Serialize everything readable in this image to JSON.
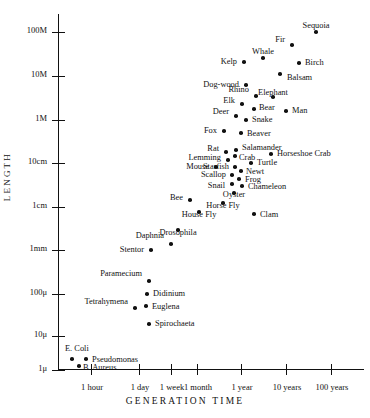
{
  "chart_data": {
    "type": "scatter",
    "title": "",
    "xlabel": "GENERATION TIME",
    "ylabel": "LENGTH",
    "grid": false,
    "legend": null,
    "xscale": "log",
    "yscale": "log",
    "xticks": [
      "1 hour",
      "1 day",
      "1 week",
      "1 month",
      "1 year",
      "10 years",
      "100 years"
    ],
    "yticks": [
      "100M",
      "10M",
      "1M",
      "10cm",
      "1cm",
      "1mm",
      "100μ",
      "10μ",
      "1μ"
    ],
    "points": [
      {
        "label": "Sequoia",
        "x": "30 years",
        "y": "80M",
        "px": 315,
        "py": 32,
        "lx": 315,
        "ly": 22,
        "lp": "b",
        "lsx": 0,
        "lsy": -10
      },
      {
        "label": "Fir",
        "x": "18 years",
        "y": "45M",
        "px": 291,
        "py": 45,
        "lx": 284,
        "ly": 40,
        "lp": "r",
        "lsx": -8,
        "lsy": -4
      },
      {
        "label": "Birch",
        "x": "22 years",
        "y": "22M",
        "px": 298,
        "py": 63,
        "lx": 304,
        "ly": 63,
        "lp": "l",
        "lsx": 7,
        "lsy": 0
      },
      {
        "label": "Whale",
        "x": "10 years",
        "y": "25M",
        "px": 262,
        "py": 58,
        "lx": 262,
        "ly": 48,
        "lp": "b",
        "lsx": 0,
        "lsy": -10
      },
      {
        "label": "Kelp",
        "x": "5 years",
        "y": "22M",
        "px": 243,
        "py": 62,
        "lx": 236,
        "ly": 62,
        "lp": "r",
        "lsx": -8,
        "lsy": 0
      },
      {
        "label": "Balsam",
        "x": "14 years",
        "y": "12M",
        "px": 279,
        "py": 74,
        "lx": 286,
        "ly": 78,
        "lp": "l",
        "lsx": 7,
        "lsy": 4
      },
      {
        "label": "Dog-wood",
        "x": "5 years",
        "y": "9M",
        "px": 245,
        "py": 85,
        "lx": 238,
        "ly": 85,
        "lp": "r",
        "lsx": -8,
        "lsy": 0
      },
      {
        "label": "Elephant",
        "x": "12 years",
        "y": "5M",
        "px": 272,
        "py": 97,
        "lx": 272,
        "ly": 89,
        "lp": "b",
        "lsx": 0,
        "lsy": -9
      },
      {
        "label": "Rhino",
        "x": "7 years",
        "y": "3.5M",
        "px": 255,
        "py": 96,
        "lx": 248,
        "ly": 90,
        "lp": "r",
        "lsx": -8,
        "lsy": -5
      },
      {
        "label": "Elk",
        "x": "4 years",
        "y": "2.5M",
        "px": 241,
        "py": 104,
        "lx": 234,
        "ly": 101,
        "lp": "r",
        "lsx": -8,
        "lsy": -4
      },
      {
        "label": "Bear",
        "x": "6 years",
        "y": "2M",
        "px": 253,
        "py": 109,
        "lx": 258,
        "ly": 108,
        "lp": "l",
        "lsx": 6,
        "lsy": 0
      },
      {
        "label": "Man",
        "x": "16 years",
        "y": "1.8M",
        "px": 285,
        "py": 111,
        "lx": 291,
        "ly": 111,
        "lp": "l",
        "lsx": 6,
        "lsy": 0
      },
      {
        "label": "Deer",
        "x": "3.5 years",
        "y": "1.5M",
        "px": 235,
        "py": 116,
        "lx": 228,
        "ly": 112,
        "lp": "r",
        "lsx": -8,
        "lsy": -4
      },
      {
        "label": "Snake",
        "x": "5 years",
        "y": "1.2M",
        "px": 245,
        "py": 120,
        "lx": 251,
        "ly": 120,
        "lp": "l",
        "lsx": 6,
        "lsy": 0
      },
      {
        "label": "Beaver",
        "x": "4 years",
        "y": "70cm",
        "px": 240,
        "py": 133,
        "lx": 246,
        "ly": 134,
        "lp": "l",
        "lsx": 6,
        "lsy": 0
      },
      {
        "label": "Fox",
        "x": "2.5 years",
        "y": "60cm",
        "px": 223,
        "py": 131,
        "lx": 216,
        "ly": 131,
        "lp": "r",
        "lsx": -8,
        "lsy": 0
      },
      {
        "label": "Salamander",
        "x": "3.5 years",
        "y": "22cm",
        "px": 235,
        "py": 150,
        "lx": 241,
        "ly": 148,
        "lp": "l",
        "lsx": 6,
        "lsy": -2
      },
      {
        "label": "Horseshoe Crab",
        "x": "9 years",
        "y": "20cm",
        "px": 270,
        "py": 154,
        "lx": 276,
        "ly": 154,
        "lp": "l",
        "lsx": 6,
        "lsy": 0
      },
      {
        "label": "Rat",
        "x": "2.5 years",
        "y": "20cm",
        "px": 225,
        "py": 152,
        "lx": 218,
        "ly": 149,
        "lp": "r",
        "lsx": -8,
        "lsy": -3
      },
      {
        "label": "Crab",
        "x": "3.5 years",
        "y": "16cm",
        "px": 234,
        "py": 156,
        "lx": 238,
        "ly": 158,
        "lp": "l",
        "lsx": 5,
        "lsy": 1
      },
      {
        "label": "Lemming",
        "x": "2.2 years",
        "y": "14cm",
        "px": 227,
        "py": 160,
        "lx": 220,
        "ly": 158,
        "lp": "r",
        "lsx": -8,
        "lsy": -2
      },
      {
        "label": "Turtle",
        "x": "5.5 years",
        "y": "13cm",
        "px": 250,
        "py": 163,
        "lx": 256,
        "ly": 163,
        "lp": "l",
        "lsx": 6,
        "lsy": 0
      },
      {
        "label": "Mouse",
        "x": "1.8 years",
        "y": "11cm",
        "px": 215,
        "py": 167,
        "lx": 208,
        "ly": 167,
        "lp": "r",
        "lsx": -8,
        "lsy": 0
      },
      {
        "label": "Starfish",
        "x": "2.6 years",
        "y": "11cm",
        "px": 234,
        "py": 167,
        "lx": 228,
        "ly": 167,
        "lp": "r",
        "lsx": -7,
        "lsy": 0
      },
      {
        "label": "Newt",
        "x": "3.4 years",
        "y": "10cm",
        "px": 240,
        "py": 171,
        "lx": 245,
        "ly": 172,
        "lp": "l",
        "lsx": 5,
        "lsy": 1
      },
      {
        "label": "Scallop",
        "x": "2.5 years",
        "y": "8cm",
        "px": 231,
        "py": 175,
        "lx": 225,
        "ly": 175,
        "lp": "r",
        "lsx": -7,
        "lsy": 0
      },
      {
        "label": "Frog",
        "x": "3.2 years",
        "y": "7cm",
        "px": 238,
        "py": 179,
        "lx": 244,
        "ly": 180,
        "lp": "l",
        "lsx": 5,
        "lsy": 1
      },
      {
        "label": "Snail",
        "x": "2.6 years",
        "y": "5.5cm",
        "px": 231,
        "py": 184,
        "lx": 224,
        "ly": 186,
        "lp": "r",
        "lsx": -7,
        "lsy": 2
      },
      {
        "label": "Chameleon",
        "x": "3.4 years",
        "y": "5.5cm",
        "px": 241,
        "py": 186,
        "lx": 247,
        "ly": 187,
        "lp": "l",
        "lsx": 5,
        "lsy": 1
      },
      {
        "label": "Oyster",
        "x": "2.8 years",
        "y": "4cm",
        "px": 233,
        "py": 193,
        "lx": 233,
        "ly": 199,
        "lp": "t",
        "lsx": 0,
        "lsy": 7
      },
      {
        "label": "Bee",
        "x": "1.6 years",
        "y": "1.8cm",
        "px": 189,
        "py": 200,
        "lx": 182,
        "ly": 198,
        "lp": "r",
        "lsx": -8,
        "lsy": -3
      },
      {
        "label": "Horse Fly",
        "x": "2.6 years",
        "y": "1.7cm",
        "px": 222,
        "py": 203,
        "lx": 222,
        "ly": 210,
        "lp": "t",
        "lsx": 0,
        "lsy": 8
      },
      {
        "label": "Clam",
        "x": "4 years",
        "y": "1.1cm",
        "px": 253,
        "py": 214,
        "lx": 259,
        "ly": 215,
        "lp": "l",
        "lsx": 6,
        "lsy": 1
      },
      {
        "label": "House Fly",
        "x": "1.8 years",
        "y": "1cm",
        "px": 198,
        "py": 212,
        "lx": 198,
        "ly": 219,
        "lp": "t",
        "lsx": 0,
        "lsy": 8
      },
      {
        "label": "Drosophila",
        "x": "1.4 years",
        "y": "3mm",
        "px": 177,
        "py": 230,
        "lx": 177,
        "ly": 237,
        "lp": "t",
        "lsx": 0,
        "lsy": 8
      },
      {
        "label": "Daphnia",
        "x": "2 weeks",
        "y": "2.4mm",
        "px": 170,
        "py": 244,
        "lx": 163,
        "ly": 236,
        "lp": "r",
        "lsx": -8,
        "lsy": -8
      },
      {
        "label": "Stentor",
        "x": "2 days",
        "y": "1mm",
        "px": 150,
        "py": 250,
        "lx": 143,
        "ly": 250,
        "lp": "r",
        "lsx": -8,
        "lsy": 0
      },
      {
        "label": "Paramecium",
        "x": "1.5 days",
        "y": "260μ",
        "px": 148,
        "py": 281,
        "lx": 141,
        "ly": 274,
        "lp": "r",
        "lsx": -8,
        "lsy": -8
      },
      {
        "label": "Didinium",
        "x": "1.4 days",
        "y": "110μ",
        "px": 146,
        "py": 294,
        "lx": 152,
        "ly": 294,
        "lp": "l",
        "lsx": 6,
        "lsy": 0
      },
      {
        "label": "Tetrahymena",
        "x": "1 day",
        "y": "50μ",
        "px": 134,
        "py": 308,
        "lx": 127,
        "ly": 302,
        "lp": "r",
        "lsx": -8,
        "lsy": -6
      },
      {
        "label": "Euglena",
        "x": "1.3 days",
        "y": "45μ",
        "px": 145,
        "py": 306,
        "lx": 151,
        "ly": 307,
        "lp": "l",
        "lsx": 6,
        "lsy": 1
      },
      {
        "label": "Spirochaeta",
        "x": "1.4 days",
        "y": "22μ",
        "px": 148,
        "py": 324,
        "lx": 154,
        "ly": 324,
        "lp": "l",
        "lsx": 6,
        "lsy": 0
      },
      {
        "label": "E. Coli",
        "x": "25 min",
        "y": "3μ",
        "px": 71,
        "py": 359,
        "lx": 64,
        "ly": 349,
        "lp": "l",
        "lsx": 0,
        "lsy": -11
      },
      {
        "label": "Pseudomonas",
        "x": "35 min",
        "y": "3μ",
        "px": 85,
        "py": 359,
        "lx": 91,
        "ly": 360,
        "lp": "l",
        "lsx": 6,
        "lsy": 1
      },
      {
        "label": "B. Aureus",
        "x": "30 min",
        "y": "1.6μ",
        "px": 78,
        "py": 366,
        "lx": 82,
        "ly": 368,
        "lp": "l",
        "lsx": 4,
        "lsy": 1
      }
    ],
    "ytick_positions": [
      {
        "label": "100M",
        "py": 32
      },
      {
        "label": "10M",
        "py": 76
      },
      {
        "label": "1M",
        "py": 120
      },
      {
        "label": "10cm",
        "py": 163
      },
      {
        "label": "1cm",
        "py": 207
      },
      {
        "label": "1mm",
        "py": 250
      },
      {
        "label": "100μ",
        "py": 294
      },
      {
        "label": "10μ",
        "py": 336
      },
      {
        "label": "1μ",
        "py": 370
      }
    ],
    "xtick_positions": [
      {
        "label": "1 hour",
        "px": 90
      },
      {
        "label": "1 day",
        "px": 138
      },
      {
        "label": "1 week",
        "px": 170
      },
      {
        "label": "1 month",
        "px": 196
      },
      {
        "label": "1 year",
        "px": 240
      },
      {
        "label": "10 years",
        "px": 285
      },
      {
        "label": "100 years",
        "px": 330
      }
    ]
  }
}
